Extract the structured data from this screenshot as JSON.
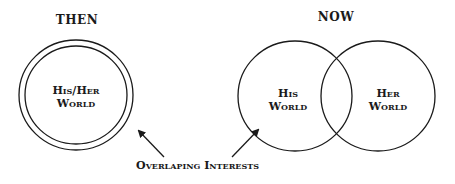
{
  "then": {
    "title": "THEN",
    "circle_label_line1": "His/Her",
    "circle_label_line2": "World"
  },
  "now": {
    "title": "NOW",
    "left_label_line1": "His",
    "left_label_line2": "World",
    "right_label_line1": "Her",
    "right_label_line2": "World"
  },
  "annotation": {
    "label": "Overlaping Interests"
  },
  "colors": {
    "stroke": "#1a1a1a",
    "background": "#ffffff"
  }
}
